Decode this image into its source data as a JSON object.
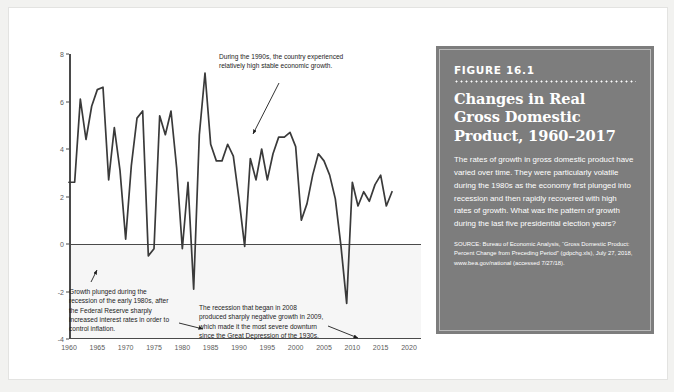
{
  "panel": {
    "figure_number": "FIGURE 16.1",
    "title": "Changes in Real Gross Domestic Product, 1960–2017",
    "body": "The rates of growth in gross domestic product have varied over time. They were particularly volatile during the 1980s as the economy first plunged into recession and then rapidly recovered with high rates of growth. What was the pattern of growth during the last five presidential election years?",
    "source": "SOURCE: Bureau of Economic Analysis, “Gross Domestic Product: Percent Change from Preceding Period” (gdpchg.xls), July 27, 2018, www.bea.gov/national (accessed 7/27/18)."
  },
  "annotations": {
    "nineties": "During the 1990s, the country experienced relatively high stable economic growth.",
    "eighties": "Growth plunged during the recession of the early 1980s, after the Federal Reserve sharply increased interest rates in order to control inflation.",
    "two_thousand_eight": "The recession that began in 2008 produced sharply negative growth in 2009, which made it the most severe downturn since the Great Depression of the 1930s."
  },
  "chart_data": {
    "type": "line",
    "title": "Changes in Real Gross Domestic Product, 1960–2017",
    "xlabel": "",
    "ylabel": "",
    "xlim": [
      1960,
      2020
    ],
    "ylim": [
      -4,
      8
    ],
    "yticks": [
      -4,
      -2,
      0,
      2,
      4,
      6,
      8
    ],
    "xticks": [
      1960,
      1965,
      1970,
      1975,
      1980,
      1985,
      1990,
      1995,
      2000,
      2005,
      2010,
      2015,
      2020
    ],
    "grid": false,
    "legend": false,
    "line_color": "#3a3a3a",
    "x": [
      1960,
      1961,
      1962,
      1963,
      1964,
      1965,
      1966,
      1967,
      1968,
      1969,
      1970,
      1971,
      1972,
      1973,
      1974,
      1975,
      1976,
      1977,
      1978,
      1979,
      1980,
      1981,
      1982,
      1983,
      1984,
      1985,
      1986,
      1987,
      1988,
      1989,
      1990,
      1991,
      1992,
      1993,
      1994,
      1995,
      1996,
      1997,
      1998,
      1999,
      2000,
      2001,
      2002,
      2003,
      2004,
      2005,
      2006,
      2007,
      2008,
      2009,
      2010,
      2011,
      2012,
      2013,
      2014,
      2015,
      2016,
      2017
    ],
    "values": [
      2.6,
      2.6,
      6.1,
      4.4,
      5.8,
      6.5,
      6.6,
      2.7,
      4.9,
      3.1,
      0.2,
      3.3,
      5.3,
      5.6,
      -0.5,
      -0.2,
      5.4,
      4.6,
      5.6,
      3.2,
      -0.2,
      2.6,
      -1.9,
      4.6,
      7.2,
      4.2,
      3.5,
      3.5,
      4.2,
      3.7,
      1.9,
      -0.1,
      3.6,
      2.7,
      4.0,
      2.7,
      3.8,
      4.5,
      4.5,
      4.7,
      4.1,
      1.0,
      1.7,
      2.9,
      3.8,
      3.5,
      2.9,
      1.9,
      -0.1,
      -2.5,
      2.6,
      1.6,
      2.2,
      1.8,
      2.5,
      2.9,
      1.6,
      2.2
    ],
    "series_name": "Percent change in real GDP from preceding period"
  }
}
